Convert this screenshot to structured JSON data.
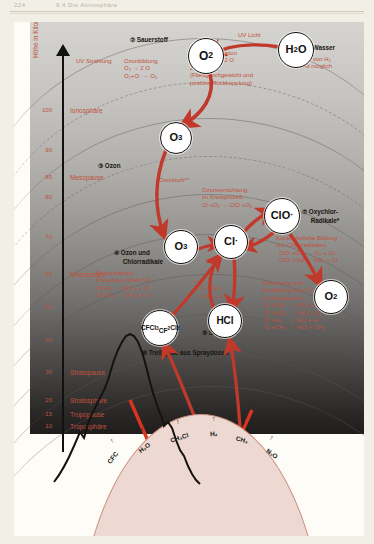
{
  "page": {
    "folio": "224",
    "running_title": "9.4 Die Atmosphäre"
  },
  "figure": {
    "axis_title": "Höhe in\nKilometern",
    "ticks": [
      {
        "value": "100",
        "y": 88
      },
      {
        "value": "90",
        "y": 128
      },
      {
        "value": "85",
        "y": 155
      },
      {
        "value": "80",
        "y": 175
      },
      {
        "value": "70",
        "y": 215
      },
      {
        "value": "60",
        "y": 252
      },
      {
        "value": "50",
        "y": 285
      },
      {
        "value": "40",
        "y": 318
      },
      {
        "value": "30",
        "y": 350
      },
      {
        "value": "20",
        "y": 378
      },
      {
        "value": "15",
        "y": 392
      },
      {
        "value": "10",
        "y": 404
      }
    ],
    "layers": [
      {
        "label": "Ionosphäre",
        "y": 88
      },
      {
        "label": "Mesopause",
        "y": 155
      },
      {
        "label": "Mesosphäre",
        "y": 252
      },
      {
        "label": "Stratopause",
        "y": 350
      },
      {
        "label": "Stratosphäre",
        "y": 378
      },
      {
        "label": "Tropopause",
        "y": 392
      },
      {
        "label": "Troposphäre",
        "y": 404
      }
    ],
    "molecules": [
      {
        "id": "o2-top",
        "html": "O<sub>2</sub>"
      },
      {
        "id": "h2o",
        "html": "H<sub>2</sub>O"
      },
      {
        "id": "o3-upper",
        "html": "O<sub>3</sub>"
      },
      {
        "id": "o3-lower",
        "html": "O<sub>3</sub>"
      },
      {
        "id": "cl",
        "html": "Cl<span class=\"dot\">·</span>"
      },
      {
        "id": "clo",
        "html": "ClO<span class=\"dot\">·</span>"
      },
      {
        "id": "hcl",
        "html": "HCl"
      },
      {
        "id": "o2-right",
        "html": "O<sub>2</sub>"
      },
      {
        "id": "cfc",
        "html": "CFCl<sub>3</sub><br>CF<sub>2</sub>Cl<sub>2</sub>"
      }
    ],
    "captions": [
      {
        "id": "wasser",
        "text": "① Wasser"
      },
      {
        "id": "sauerstoff",
        "text": "② Sauerstoff"
      },
      {
        "id": "ozon",
        "text": "③ Ozon"
      },
      {
        "id": "ozon-chlor",
        "text": "④ Ozon und\n     Chlorradikale"
      },
      {
        "id": "salzsaeure",
        "text": "⑤ Salzsäure"
      },
      {
        "id": "treibgase",
        "text": "⑥ Treibgase aus Spraydosen"
      },
      {
        "id": "oxychlor",
        "text": "⑦ Oxychlor-\n     Radikale*"
      }
    ],
    "annotations": {
      "uv_strahlung": "UV Strahlung",
      "uv_licht": "UV Licht",
      "ozonbildung": "Ozonbildung\nO₂ → 2 O\nO₂+O  → O₃",
      "photodissoziation": "Photodissoziation\nH₂O → H₂ + 2 O\n2 O   → O₂\n(Fließgleichgewicht und\npositive Rückkopplung)",
      "export_h2": "Export von H₂\nins All möglich",
      "ozonloch": "Ozonloch**",
      "ozonvernichtung": "Ozonvernichtung\nim Kreisprozeß\nCl·+O₃ → ClO·+O₂",
      "grundreaktion": "Grundreaktion\nPhotolyse mittels UV\nCFCl₃ → CFCl₂ + Cl·\nCF₂Cl₂ → CF₂Cl + Cl·",
      "kontinuierliche": "Kontinuierliche Bildung\nvon Chlorradikalen\n  ClO·+O·   → O₂ + Cl·\n  ClO·+NO → NO₂ + Cl·",
      "entfernung": "Entfernung und\nNeubildung von Cl·\nim Kreisprozeß\n Cl·+OH·  → HCl + O·\n Cl·+HO₂· → HCl + O₂\n Cl·+H₂    → HCl + H·\n Cl·+CH₄  → HCl + CH₃·",
      "hcl_oh": "+++\nHCl + OH·\n→ H₂O + Cl·"
    },
    "surface_emissions": [
      {
        "label": "CFC",
        "x": 30,
        "rot": -52
      },
      {
        "label": "H₂O",
        "x": 66,
        "rot": -36
      },
      {
        "label": "CH₃Cl",
        "x": 104,
        "rot": -18
      },
      {
        "label": "H₂",
        "x": 142,
        "rot": -4
      },
      {
        "label": "CH₄",
        "x": 172,
        "rot": 16
      },
      {
        "label": "N₂O",
        "x": 202,
        "rot": 34
      }
    ]
  },
  "colors": {
    "annotation_red": "#c1503c",
    "arrow_red": "#c0392b",
    "earth_fill": "#edd9d2",
    "paper": "#f2efe6"
  }
}
